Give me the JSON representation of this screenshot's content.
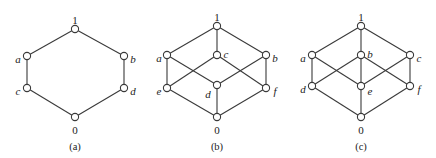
{
  "diagrams": [
    {
      "id": "a",
      "caption": "(a)",
      "caption_pos": [
        75,
        148
      ],
      "nodes": [
        {
          "id": "1",
          "label": "1",
          "x": 75,
          "y": 29,
          "lx": 75,
          "ly": 21,
          "anchor": "middle",
          "italic": false
        },
        {
          "id": "a",
          "label": "a",
          "x": 27,
          "y": 56,
          "lx": 18,
          "ly": 60,
          "anchor": "middle",
          "italic": true
        },
        {
          "id": "b",
          "label": "b",
          "x": 124,
          "y": 56,
          "lx": 133,
          "ly": 60,
          "anchor": "middle",
          "italic": true
        },
        {
          "id": "c",
          "label": "c",
          "x": 27,
          "y": 88,
          "lx": 18,
          "ly": 92,
          "anchor": "middle",
          "italic": true
        },
        {
          "id": "d",
          "label": "d",
          "x": 124,
          "y": 88,
          "lx": 133,
          "ly": 92,
          "anchor": "middle",
          "italic": true
        },
        {
          "id": "0",
          "label": "0",
          "x": 75,
          "y": 117,
          "lx": 75,
          "ly": 131,
          "anchor": "middle",
          "italic": false
        }
      ],
      "edges": [
        [
          "1",
          "a"
        ],
        [
          "1",
          "b"
        ],
        [
          "a",
          "c"
        ],
        [
          "b",
          "d"
        ],
        [
          "c",
          "0"
        ],
        [
          "d",
          "0"
        ]
      ]
    },
    {
      "id": "b",
      "caption": "(b)",
      "caption_pos": [
        217,
        148
      ],
      "nodes": [
        {
          "id": "1",
          "label": "1",
          "x": 217,
          "y": 26,
          "lx": 217,
          "ly": 18,
          "anchor": "middle",
          "italic": false
        },
        {
          "id": "a",
          "label": "a",
          "x": 167,
          "y": 55,
          "lx": 159,
          "ly": 59,
          "anchor": "middle",
          "italic": true
        },
        {
          "id": "c",
          "label": "c",
          "x": 217,
          "y": 55,
          "lx": 226,
          "ly": 55,
          "anchor": "middle",
          "italic": true
        },
        {
          "id": "b",
          "label": "b",
          "x": 266,
          "y": 55,
          "lx": 275,
          "ly": 59,
          "anchor": "middle",
          "italic": true
        },
        {
          "id": "e",
          "label": "e",
          "x": 167,
          "y": 88,
          "lx": 159,
          "ly": 92,
          "anchor": "middle",
          "italic": true
        },
        {
          "id": "d",
          "label": "d",
          "x": 217,
          "y": 85,
          "lx": 208,
          "ly": 95,
          "anchor": "middle",
          "italic": true
        },
        {
          "id": "f",
          "label": "f",
          "x": 266,
          "y": 88,
          "lx": 275,
          "ly": 92,
          "anchor": "middle",
          "italic": true
        },
        {
          "id": "0",
          "label": "0",
          "x": 217,
          "y": 117,
          "lx": 217,
          "ly": 131,
          "anchor": "middle",
          "italic": false
        }
      ],
      "edges": [
        [
          "1",
          "a"
        ],
        [
          "1",
          "c"
        ],
        [
          "1",
          "b"
        ],
        [
          "a",
          "e"
        ],
        [
          "a",
          "d"
        ],
        [
          "c",
          "e"
        ],
        [
          "c",
          "f"
        ],
        [
          "b",
          "d"
        ],
        [
          "b",
          "f"
        ],
        [
          "e",
          "0"
        ],
        [
          "d",
          "0"
        ],
        [
          "f",
          "0"
        ]
      ]
    },
    {
      "id": "c",
      "caption": "(c)",
      "caption_pos": [
        361,
        148
      ],
      "nodes": [
        {
          "id": "1",
          "label": "1",
          "x": 361,
          "y": 26,
          "lx": 361,
          "ly": 18,
          "anchor": "middle",
          "italic": false
        },
        {
          "id": "a",
          "label": "a",
          "x": 312,
          "y": 55,
          "lx": 303,
          "ly": 59,
          "anchor": "middle",
          "italic": true
        },
        {
          "id": "b",
          "label": "b",
          "x": 361,
          "y": 55,
          "lx": 370,
          "ly": 55,
          "anchor": "middle",
          "italic": true
        },
        {
          "id": "c",
          "label": "c",
          "x": 410,
          "y": 55,
          "lx": 419,
          "ly": 59,
          "anchor": "middle",
          "italic": true
        },
        {
          "id": "d",
          "label": "d",
          "x": 312,
          "y": 86,
          "lx": 303,
          "ly": 90,
          "anchor": "middle",
          "italic": true
        },
        {
          "id": "e",
          "label": "e",
          "x": 361,
          "y": 86,
          "lx": 370,
          "ly": 92,
          "anchor": "middle",
          "italic": true
        },
        {
          "id": "f",
          "label": "f",
          "x": 410,
          "y": 86,
          "lx": 419,
          "ly": 90,
          "anchor": "middle",
          "italic": true
        },
        {
          "id": "0",
          "label": "0",
          "x": 361,
          "y": 117,
          "lx": 361,
          "ly": 131,
          "anchor": "middle",
          "italic": false
        }
      ],
      "edges": [
        [
          "1",
          "a"
        ],
        [
          "1",
          "b"
        ],
        [
          "1",
          "c"
        ],
        [
          "a",
          "d"
        ],
        [
          "a",
          "e"
        ],
        [
          "b",
          "d"
        ],
        [
          "b",
          "e"
        ],
        [
          "b",
          "f"
        ],
        [
          "c",
          "e"
        ],
        [
          "c",
          "f"
        ],
        [
          "d",
          "0"
        ],
        [
          "e",
          "0"
        ],
        [
          "f",
          "0"
        ]
      ]
    }
  ],
  "style": {
    "line_color": "#3a3a3a",
    "node_fill": "#ffffff",
    "node_radius": 3.6
  }
}
